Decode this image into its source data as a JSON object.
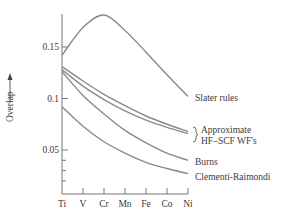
{
  "chart_data": {
    "type": "line",
    "title": "",
    "xlabel": "",
    "ylabel": "Overlap",
    "ylabel_arrow": "up-arrow",
    "categories": [
      "Ti",
      "V",
      "Cr",
      "Mn",
      "Fe",
      "Co",
      "Ni"
    ],
    "y_ticks": [
      {
        "value": 0.15,
        "label": "0.15"
      },
      {
        "value": 0.1,
        "label": "0.1"
      },
      {
        "value": 0.05,
        "label": "0.05"
      }
    ],
    "y_minor_ticks": [
      0.04,
      0.03,
      0.02
    ],
    "ylim": [
      0.007,
      0.183
    ],
    "grid": false,
    "legend_position": "inline-right",
    "series": [
      {
        "name": "Slater rules",
        "values": [
          0.142,
          0.169,
          0.181,
          0.166,
          0.145,
          0.123,
          0.102
        ]
      },
      {
        "name": "Approximate HF-SCF WF's (1)",
        "values": [
          0.131,
          0.117,
          0.104,
          0.093,
          0.083,
          0.075,
          0.068
        ]
      },
      {
        "name": "Approximate HF-SCF WF's (2)",
        "values": [
          0.128,
          0.112,
          0.099,
          0.088,
          0.079,
          0.072,
          0.066
        ]
      },
      {
        "name": "Burns",
        "values": [
          0.126,
          0.103,
          0.085,
          0.069,
          0.057,
          0.047,
          0.04
        ]
      },
      {
        "name": "Clementi-Raimondi",
        "values": [
          0.092,
          0.073,
          0.058,
          0.047,
          0.038,
          0.032,
          0.027
        ]
      }
    ],
    "annotations": {
      "slater": "Slater rules",
      "hf_line1": "Approximate",
      "hf_line2": "HF–SCF WF's",
      "burns": "Burns",
      "clementi": "Clementi-Raimondi"
    }
  }
}
